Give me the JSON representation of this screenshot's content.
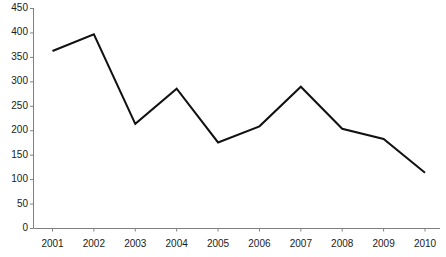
{
  "chart_data": {
    "type": "line",
    "title": "",
    "xlabel": "",
    "ylabel": "",
    "categories": [
      "2001",
      "2002",
      "2003",
      "2004",
      "2005",
      "2006",
      "2007",
      "2008",
      "2009",
      "2010"
    ],
    "values": [
      362,
      396,
      213,
      285,
      175,
      208,
      289,
      203,
      182,
      113
    ],
    "series": [
      {
        "name": "series-1",
        "values": [
          362,
          396,
          213,
          285,
          175,
          208,
          289,
          203,
          182,
          113
        ]
      }
    ],
    "ylim": [
      0,
      450
    ],
    "yticks": [
      0,
      50,
      100,
      150,
      200,
      250,
      300,
      350,
      400,
      450
    ],
    "ytick_labels": [
      "0",
      "50",
      "100",
      "150",
      "200",
      "250",
      "300",
      "350",
      "400",
      "450"
    ],
    "xtick_labels": [
      "2001",
      "2002",
      "2003",
      "2004",
      "2005",
      "2006",
      "2007",
      "2008",
      "2009",
      "2010"
    ],
    "grid": false,
    "legend": false,
    "legend_position": "none",
    "line_color": "#111111",
    "axis_color": "#808080",
    "markers": false
  }
}
